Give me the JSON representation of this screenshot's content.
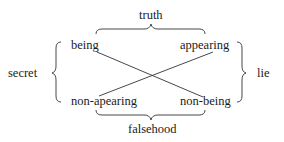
{
  "diagram": {
    "type": "semiotic-square",
    "nodes": {
      "top_left": "being",
      "top_right": "appearing",
      "bottom_left": "non-apearing",
      "bottom_right": "non-being"
    },
    "relations": {
      "top": "truth",
      "bottom": "falsehood",
      "left": "secret",
      "right": "lie"
    },
    "edges": [
      {
        "from": "being",
        "to": "non-being"
      },
      {
        "from": "appearing",
        "to": "non-apearing"
      }
    ]
  }
}
